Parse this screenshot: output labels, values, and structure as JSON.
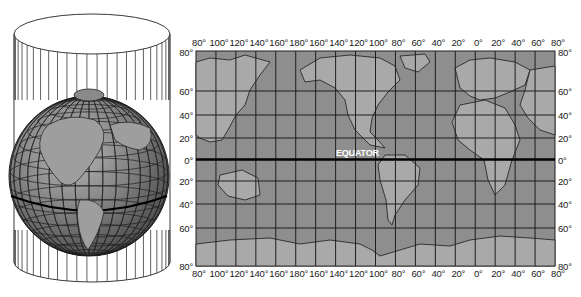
{
  "figure": {
    "equator_label": "EQUATOR",
    "colors": {
      "ocean": "#8e8e8e",
      "land": "#a9a9a9",
      "grid": "#1e1e1e",
      "equator": "#000000",
      "globe": "#7a7a7a",
      "cylinder_lines": "#3a3a3a",
      "equator_text": "#ffffff"
    }
  },
  "map": {
    "longitude_labels_top": [
      "80°",
      "100°",
      "120°",
      "140°",
      "160°",
      "180°",
      "160°",
      "140°",
      "120°",
      "100°",
      "80°",
      "60°",
      "40°",
      "20°",
      "0°",
      "20°",
      "40°",
      "60°",
      "80°"
    ],
    "longitude_labels_bottom": [
      "80°",
      "100°",
      "120°",
      "140°",
      "160°",
      "180°",
      "160°",
      "140°",
      "120°",
      "100°",
      "80°",
      "60°",
      "40°",
      "20°",
      "0°",
      "20°",
      "40°",
      "60°",
      "80°"
    ],
    "latitude_labels_left": [
      "80°",
      "60°",
      "40°",
      "20°",
      "0°",
      "20°",
      "40°",
      "60°",
      "80°"
    ],
    "latitude_labels_right": [
      "80°",
      "60°",
      "40°",
      "20°",
      "0°",
      "20°",
      "40°",
      "60°",
      "80°"
    ]
  }
}
